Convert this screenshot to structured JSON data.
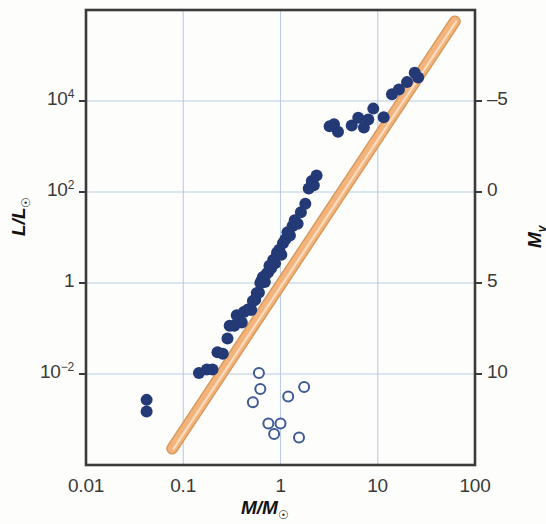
{
  "chart_data": {
    "type": "scatter",
    "title": "",
    "xlabel": "M/M⊙",
    "ylabel": "L/L⊙",
    "ylabel_right": "M_v",
    "xscale": "log",
    "yscale": "log",
    "xlim": [
      0.01,
      100
    ],
    "ylim": [
      0.0001,
      1000000.0
    ],
    "grid": true,
    "legend_position": "none",
    "xticks": [
      {
        "value": 0.01,
        "label": "0.01"
      },
      {
        "value": 0.1,
        "label": "0.1"
      },
      {
        "value": 1,
        "label": "1"
      },
      {
        "value": 10,
        "label": "10"
      },
      {
        "value": 100,
        "label": "100"
      }
    ],
    "yticks": [
      {
        "value": 10000,
        "label": "10",
        "exponent": "4"
      },
      {
        "value": 100,
        "label": "10",
        "exponent": "2"
      },
      {
        "value": 1,
        "label": "1",
        "exponent": ""
      },
      {
        "value": 0.01,
        "label": "10",
        "exponent": "−2"
      }
    ],
    "yticks_right": [
      {
        "value": 10000,
        "label": "–5"
      },
      {
        "value": 100,
        "label": "0"
      },
      {
        "value": 1,
        "label": "5"
      },
      {
        "value": 0.01,
        "label": "10"
      }
    ],
    "series": [
      {
        "name": "main-sequence stars",
        "marker": "filled-circle",
        "color": "#243a77",
        "points": [
          [
            0.042,
            0.0027
          ],
          [
            0.042,
            0.0015
          ],
          [
            0.145,
            0.0105
          ],
          [
            0.175,
            0.0125
          ],
          [
            0.2,
            0.0125
          ],
          [
            0.225,
            0.03
          ],
          [
            0.255,
            0.028
          ],
          [
            0.285,
            0.06
          ],
          [
            0.3,
            0.115
          ],
          [
            0.335,
            0.115
          ],
          [
            0.355,
            0.195
          ],
          [
            0.37,
            0.15
          ],
          [
            0.4,
            0.135
          ],
          [
            0.42,
            0.23
          ],
          [
            0.46,
            0.26
          ],
          [
            0.5,
            0.255
          ],
          [
            0.52,
            0.4
          ],
          [
            0.55,
            0.43
          ],
          [
            0.57,
            0.6
          ],
          [
            0.6,
            0.62
          ],
          [
            0.62,
            1.0
          ],
          [
            0.64,
            1.15
          ],
          [
            0.66,
            1.35
          ],
          [
            0.69,
            1.05
          ],
          [
            0.72,
            1.6
          ],
          [
            0.75,
            1.75
          ],
          [
            0.77,
            2.4
          ],
          [
            0.8,
            2.1
          ],
          [
            0.84,
            3.2
          ],
          [
            0.88,
            2.7
          ],
          [
            0.92,
            4.6
          ],
          [
            0.97,
            5.4
          ],
          [
            1.02,
            4.2
          ],
          [
            1.06,
            7.5
          ],
          [
            1.12,
            9.0
          ],
          [
            1.18,
            13.0
          ],
          [
            1.25,
            11.0
          ],
          [
            1.33,
            18.0
          ],
          [
            1.4,
            24.0
          ],
          [
            1.5,
            20.0
          ],
          [
            1.62,
            36.0
          ],
          [
            1.8,
            55.0
          ],
          [
            1.95,
            120.0
          ],
          [
            2.1,
            175.0
          ],
          [
            2.2,
            140.0
          ],
          [
            2.35,
            230.0
          ],
          [
            3.2,
            2800.0
          ],
          [
            3.55,
            3100.0
          ],
          [
            3.9,
            2100.0
          ],
          [
            5.4,
            2900.0
          ],
          [
            6.3,
            4300.0
          ],
          [
            7.2,
            2600.0
          ],
          [
            8.0,
            3900.0
          ],
          [
            9.0,
            6800.0
          ],
          [
            11.5,
            4400.0
          ],
          [
            14.0,
            14000.0
          ],
          [
            16.5,
            18000.0
          ],
          [
            20.0,
            26000.0
          ],
          [
            24.0,
            42000.0
          ],
          [
            26.0,
            33000.0
          ]
        ]
      },
      {
        "name": "white dwarfs / low-luminosity objects",
        "marker": "open-circle",
        "color": "#3f5a96",
        "points": [
          [
            0.6,
            0.0105
          ],
          [
            0.62,
            0.0047
          ],
          [
            0.52,
            0.0024
          ],
          [
            0.75,
            0.00082
          ],
          [
            1.0,
            0.00082
          ],
          [
            0.86,
            0.00048
          ],
          [
            1.2,
            0.0032
          ],
          [
            1.75,
            0.0052
          ],
          [
            1.55,
            0.0004
          ]
        ]
      }
    ],
    "fit_line": {
      "name": "mass-luminosity relation",
      "color": "#f2b47c",
      "edge_color": "#d99a5c",
      "x_start": 0.077,
      "y_start": 0.00023,
      "x_end": 62.0,
      "y_end": 560000.0
    }
  },
  "figure": {
    "background_color": "#fdfdfb",
    "frame_color": "#3b3b3b",
    "grid_color": "#b9cde4"
  }
}
